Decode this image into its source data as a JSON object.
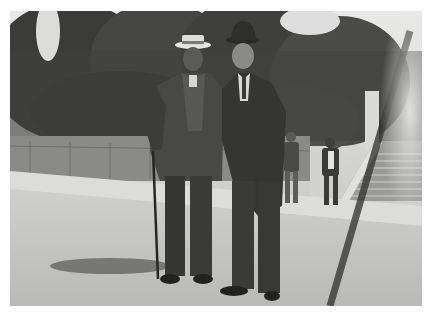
{
  "image": {
    "description": "Black-and-white historic photograph of two men in suits standing on a paved street; the left man wears a straw boater hat and holds a cane, the right man wears a bowler hat and long overcoat. Trees, a low fence, stone stairs, and two bystanders are in the background.",
    "colors": {
      "border": "#ffffff",
      "sky": "#e8e8e6",
      "trees": "#3a3a38",
      "ground": "#c4c4c2",
      "suit_dark": "#2e2e2c",
      "suit_mid": "#4a4a48"
    }
  }
}
